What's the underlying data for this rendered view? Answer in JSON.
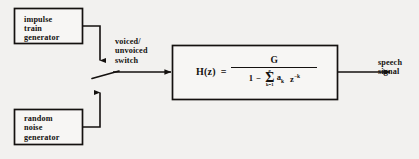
{
  "diagram": {
    "background_color": "#f2f1ef",
    "line_color": "#14110f",
    "blocks": [
      {
        "id": "impulse-train-generator",
        "label": "impulse\ntrain\ngenerator"
      },
      {
        "id": "random-noise-generator",
        "label": "random\nnoise\ngenerator"
      },
      {
        "id": "transfer-function",
        "label": "H(z) = G / (1 - sum k=1..p a_k z^-k)"
      }
    ],
    "edge_labels": {
      "switch": "voiced/\nunvoiced\nswitch",
      "output": "speech\nsignal"
    },
    "formula": {
      "lhs": "H(z)",
      "equals": "=",
      "numerator": "G",
      "den_one": "1",
      "den_minus": "−",
      "sigma_upper": "p",
      "sigma_symbol": "Σ",
      "sigma_lower": "k=1",
      "coefficient": "a",
      "coefficient_sub": "k",
      "z_base": "z",
      "z_exponent": "−k"
    }
  }
}
